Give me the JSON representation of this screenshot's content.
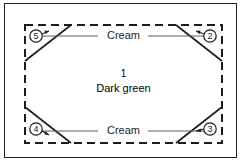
{
  "figure": {
    "outer_frame": {
      "border_color": "#222222"
    },
    "background_color": "#ffffff",
    "line_color": "#1b1b1b",
    "leader_line_color": "#777777"
  },
  "regions": {
    "center": {
      "number": "1",
      "fabric": "Dark green"
    },
    "edges": [
      {
        "id": "top",
        "fabric": "Cream"
      },
      {
        "id": "bottom",
        "fabric": "Cream"
      }
    ]
  },
  "callouts": [
    {
      "id": "callout-2",
      "number": "2",
      "position": "top-right"
    },
    {
      "id": "callout-3",
      "number": "3",
      "position": "bottom-right"
    },
    {
      "id": "callout-4",
      "number": "4",
      "position": "bottom-left"
    },
    {
      "id": "callout-5",
      "number": "5",
      "position": "top-left"
    }
  ],
  "shapes": {
    "dashed_rectangle": {
      "style": "dashed",
      "x": 25,
      "y": 25,
      "width": 197,
      "height": 118
    },
    "corner_diagonals": [
      {
        "corner": "top-left",
        "from": [
          25,
          61
        ],
        "to": [
          71,
          25
        ]
      },
      {
        "corner": "top-right",
        "from": [
          176,
          25
        ],
        "to": [
          222,
          61
        ]
      },
      {
        "corner": "bottom-left",
        "from": [
          25,
          107
        ],
        "to": [
          71,
          143
        ]
      },
      {
        "corner": "bottom-right",
        "from": [
          176,
          143
        ],
        "to": [
          222,
          107
        ]
      }
    ]
  }
}
